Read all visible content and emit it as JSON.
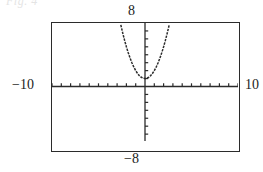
{
  "figure": {
    "crop_remnant_text": "Fig. 4",
    "viewport": {
      "xmin_label": "−10",
      "xmax_label": "10",
      "ymin_label": "−8",
      "ymax_label": "8"
    }
  },
  "chart_data": {
    "type": "line",
    "title": "",
    "xlabel": "",
    "ylabel": "",
    "xlim": [
      -10,
      10
    ],
    "ylim": [
      -8,
      8
    ],
    "grid": false,
    "legend": "none",
    "axis_style": "graphing-calculator",
    "x_tick_interval": 1,
    "y_tick_interval": 1,
    "x_tick_values": [
      -10,
      -9,
      -8,
      -7,
      -6,
      -5,
      -4,
      -3,
      -2,
      -1,
      1,
      2,
      3,
      4,
      5,
      6,
      7,
      8,
      9,
      10
    ],
    "y_tick_values": [
      -7,
      -6,
      -5,
      -4,
      -3,
      -2,
      -1,
      1,
      2,
      3,
      4,
      5,
      6,
      7
    ],
    "series": [
      {
        "name": "parabola",
        "kind": "curve",
        "color": "#2b2b2b",
        "vertex": [
          0,
          1
        ],
        "x": [
          -2.6,
          -2.4,
          -2.2,
          -2.0,
          -1.8,
          -1.6,
          -1.4,
          -1.2,
          -1.0,
          -0.8,
          -0.6,
          -0.4,
          -0.2,
          0.0,
          0.2,
          0.4,
          0.6,
          0.8,
          1.0,
          1.2,
          1.4,
          1.6,
          1.8,
          2.0,
          2.2,
          2.4,
          2.6
        ],
        "y": [
          7.76,
          6.76,
          5.84,
          5.0,
          4.24,
          3.56,
          2.96,
          2.44,
          2.0,
          1.64,
          1.36,
          1.16,
          1.04,
          1.0,
          1.04,
          1.16,
          1.36,
          1.64,
          2.0,
          2.44,
          2.96,
          3.56,
          4.24,
          5.0,
          5.84,
          6.76,
          7.76
        ]
      }
    ]
  },
  "colors": {
    "frame": "#2b2b2b",
    "axis": "#2b2b2b",
    "curve": "#2b2b2b",
    "background": "#ffffff",
    "remnant": "#cfcfcf"
  }
}
